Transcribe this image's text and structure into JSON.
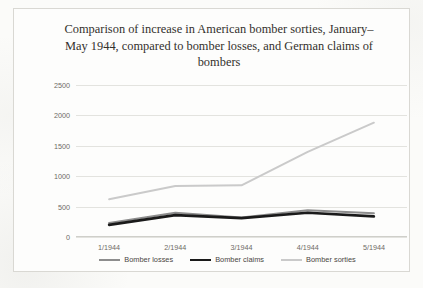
{
  "chart_data": {
    "type": "line",
    "title": "Comparison of increase in American bomber sorties, January–May 1944, compared to bomber losses, and German claims of bombers",
    "xlabel": "",
    "ylabel": "",
    "categories": [
      "1/1944",
      "2/1944",
      "3/1944",
      "4/1944",
      "5/1944"
    ],
    "ylim": [
      0,
      2500
    ],
    "ytick_values": [
      0,
      500,
      1000,
      1500,
      2000,
      2500
    ],
    "ytick_labels": [
      "0",
      "500",
      "1000",
      "1500",
      "2000",
      "2500"
    ],
    "grid": true,
    "legend_position": "bottom",
    "series": [
      {
        "name": "Bomber losses",
        "color": "#8d8d8d",
        "width": 2.0,
        "values": [
          230,
          400,
          320,
          440,
          390
        ]
      },
      {
        "name": "Bomber claims",
        "color": "#1a1a1a",
        "width": 2.6,
        "values": [
          200,
          360,
          310,
          400,
          340
        ]
      },
      {
        "name": "Bomber sorties",
        "color": "#cacaca",
        "width": 2.0,
        "values": [
          620,
          840,
          850,
          1400,
          1880
        ]
      }
    ]
  }
}
